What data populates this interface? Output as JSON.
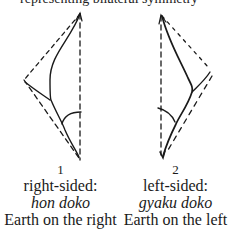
{
  "header": {
    "cut_off_text": "representing bilateral symmetry"
  },
  "figures": [
    {
      "number": "1",
      "label": "right-sided:",
      "term": "hon doko",
      "description": "Earth on the right"
    },
    {
      "number": "2",
      "label": "left-sided:",
      "term": "gyaku doko",
      "description": "Earth on the left"
    }
  ],
  "colors": {
    "ink": "#1a1a1a",
    "background": "#ffffff"
  }
}
